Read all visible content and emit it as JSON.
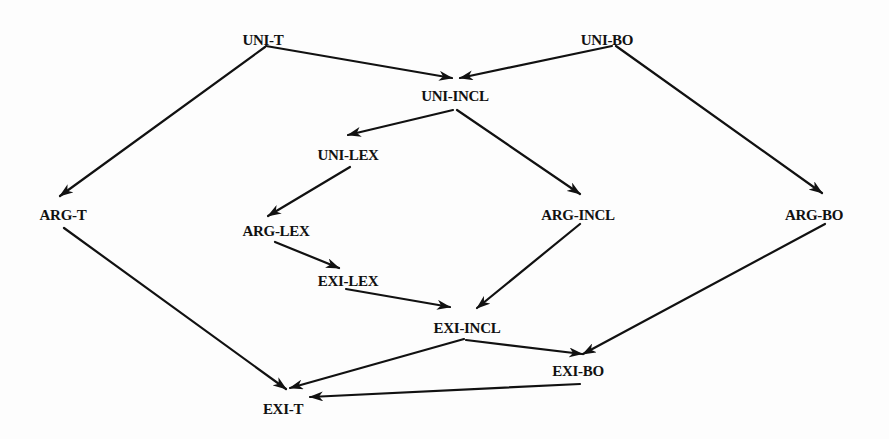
{
  "diagram": {
    "type": "directed-graph",
    "stroke_color": "#111111",
    "nodes": [
      {
        "id": "UNI-T",
        "label": "UNI-T",
        "x": 263,
        "y": 40
      },
      {
        "id": "UNI-BO",
        "label": "UNI-BO",
        "x": 607,
        "y": 40
      },
      {
        "id": "UNI-INCL",
        "label": "UNI-INCL",
        "x": 455,
        "y": 96
      },
      {
        "id": "UNI-LEX",
        "label": "UNI-LEX",
        "x": 348,
        "y": 155
      },
      {
        "id": "ARG-T",
        "label": "ARG-T",
        "x": 63,
        "y": 215
      },
      {
        "id": "ARG-LEX",
        "label": "ARG-LEX",
        "x": 276,
        "y": 231
      },
      {
        "id": "ARG-INCL",
        "label": "ARG-INCL",
        "x": 578,
        "y": 215
      },
      {
        "id": "ARG-BO",
        "label": "ARG-BO",
        "x": 814,
        "y": 215
      },
      {
        "id": "EXI-LEX",
        "label": "EXI-LEX",
        "x": 348,
        "y": 281
      },
      {
        "id": "EXI-INCL",
        "label": "EXI-INCL",
        "x": 467,
        "y": 328
      },
      {
        "id": "EXI-BO",
        "label": "EXI-BO",
        "x": 578,
        "y": 371
      },
      {
        "id": "EXI-T",
        "label": "EXI-T",
        "x": 283,
        "y": 409
      }
    ],
    "edges": [
      {
        "from": "UNI-T",
        "to": "UNI-INCL",
        "x1": 266,
        "y1": 46,
        "x2": 452,
        "y2": 78
      },
      {
        "from": "UNI-T",
        "to": "ARG-T",
        "x1": 265,
        "y1": 47,
        "x2": 60,
        "y2": 196
      },
      {
        "from": "UNI-BO",
        "to": "UNI-INCL",
        "x1": 612,
        "y1": 46,
        "x2": 460,
        "y2": 78
      },
      {
        "from": "UNI-BO",
        "to": "ARG-BO",
        "x1": 616,
        "y1": 46,
        "x2": 822,
        "y2": 193
      },
      {
        "from": "UNI-INCL",
        "to": "UNI-LEX",
        "x1": 453,
        "y1": 110,
        "x2": 348,
        "y2": 135
      },
      {
        "from": "UNI-INCL",
        "to": "ARG-INCL",
        "x1": 457,
        "y1": 110,
        "x2": 580,
        "y2": 194
      },
      {
        "from": "UNI-LEX",
        "to": "ARG-LEX",
        "x1": 350,
        "y1": 167,
        "x2": 268,
        "y2": 216
      },
      {
        "from": "ARG-LEX",
        "to": "EXI-LEX",
        "x1": 275,
        "y1": 242,
        "x2": 339,
        "y2": 268
      },
      {
        "from": "EXI-LEX",
        "to": "EXI-INCL",
        "x1": 346,
        "y1": 289,
        "x2": 450,
        "y2": 307
      },
      {
        "from": "ARG-INCL",
        "to": "EXI-INCL",
        "x1": 580,
        "y1": 224,
        "x2": 477,
        "y2": 308
      },
      {
        "from": "ARG-BO",
        "to": "EXI-BO",
        "x1": 825,
        "y1": 224,
        "x2": 583,
        "y2": 354
      },
      {
        "from": "ARG-T",
        "to": "EXI-T",
        "x1": 64,
        "y1": 228,
        "x2": 286,
        "y2": 389
      },
      {
        "from": "EXI-INCL",
        "to": "EXI-T",
        "x1": 464,
        "y1": 339,
        "x2": 290,
        "y2": 388
      },
      {
        "from": "EXI-INCL",
        "to": "EXI-BO",
        "x1": 466,
        "y1": 340,
        "x2": 582,
        "y2": 354
      },
      {
        "from": "EXI-BO",
        "to": "EXI-T",
        "x1": 580,
        "y1": 384,
        "x2": 310,
        "y2": 397
      }
    ]
  }
}
